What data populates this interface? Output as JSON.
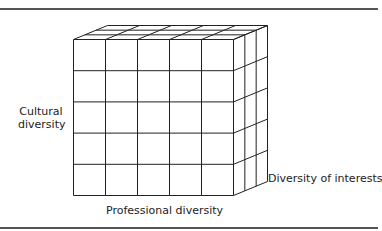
{
  "diagram": {
    "type": "3d-cube-grid",
    "grid": {
      "columns": 5,
      "rows": 5,
      "depth": 3
    },
    "axes": {
      "vertical": {
        "label_lines": [
          "Cultural",
          "diversity"
        ]
      },
      "horizontal": {
        "label": "Professional diversity"
      },
      "depth": {
        "label": "Diversity of interests"
      }
    },
    "colors": {
      "line": "#222222",
      "rule": "#555555",
      "background": "#ffffff"
    }
  }
}
